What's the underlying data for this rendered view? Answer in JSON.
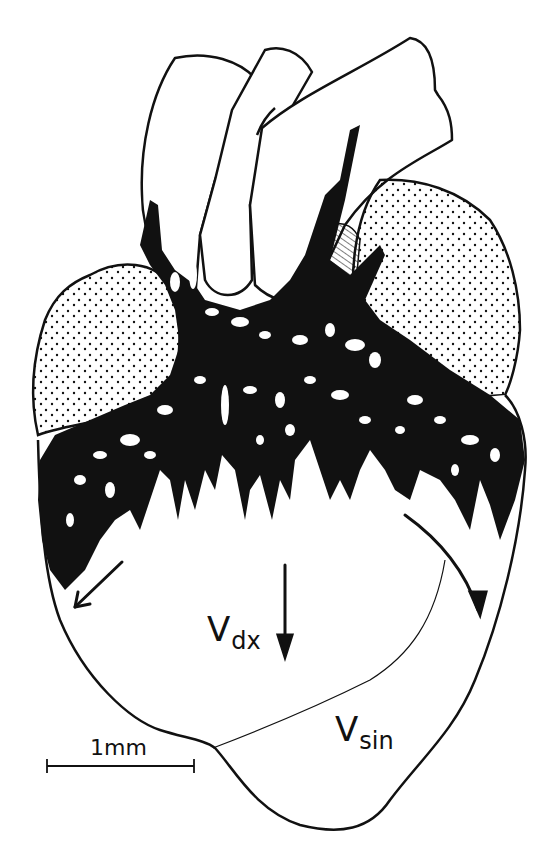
{
  "figure": {
    "type": "anatomical line drawing",
    "colors": {
      "ink": "#111111",
      "background": "#ffffff",
      "stipple": "#111111"
    }
  },
  "labels": {
    "right_ventricle": {
      "main": "V",
      "sub": "dx"
    },
    "left_ventricle": {
      "main": "V",
      "sub": "sin"
    }
  },
  "scale_bar": {
    "text": "1mm"
  },
  "regions": [
    {
      "id": "great-vessels",
      "fill": "outline"
    },
    {
      "id": "left-atrium",
      "fill": "stippled"
    },
    {
      "id": "right-atrium",
      "fill": "stippled"
    },
    {
      "id": "hatched-structure",
      "fill": "hatched"
    },
    {
      "id": "coronary-network",
      "fill": "solid black"
    },
    {
      "id": "ventricles",
      "fill": "outline"
    }
  ],
  "arrows": [
    {
      "id": "left-arrow",
      "direction": "down-left"
    },
    {
      "id": "center-arrow",
      "direction": "down"
    },
    {
      "id": "right-arrow",
      "direction": "down-right (curved)"
    }
  ]
}
